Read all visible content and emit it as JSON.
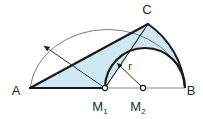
{
  "figure": {
    "colors": {
      "fill": "#cfe9f2",
      "stroke_dark": "#1a1a1a",
      "stroke_thin": "#6b6b6b",
      "baseline": "#8a8a8a",
      "label": "#2b2b2b",
      "background": "#ffffff"
    },
    "points": [
      {
        "name": "A",
        "label": "A",
        "x": 30,
        "y": 88,
        "label_x": 16,
        "label_y": 95,
        "marker": "none"
      },
      {
        "name": "B",
        "label": "B",
        "x": 185,
        "y": 88,
        "label_x": 191,
        "label_y": 95,
        "marker": "none"
      },
      {
        "name": "C",
        "label": "C",
        "x": 148,
        "y": 24,
        "label_x": 145,
        "label_y": 14,
        "marker": "none"
      },
      {
        "name": "M1",
        "label": "M",
        "sub": "1",
        "x": 105,
        "y": 88,
        "label_x": 98,
        "label_y": 111,
        "marker": "open-circle"
      },
      {
        "name": "M2",
        "label": "M",
        "sub": "2",
        "x": 143,
        "y": 88,
        "label_x": 136,
        "label_y": 111,
        "marker": "open-circle"
      }
    ],
    "annotations": [
      {
        "name": "radius-r",
        "label": "r",
        "x": 130,
        "y": 68
      }
    ],
    "arcs": [
      {
        "name": "large-semicircle",
        "from": "A",
        "to": "B",
        "center": "M1",
        "style": "thin"
      },
      {
        "name": "small-semicircle",
        "from": "M1",
        "to": "B",
        "center": "M2",
        "style": "thick"
      },
      {
        "name": "arc-c-to-b",
        "from": "C",
        "to": "B",
        "style": "thick"
      }
    ],
    "segments": [
      {
        "name": "baseline-AB",
        "from": "A",
        "to": "B"
      },
      {
        "name": "side-AC",
        "from": "A",
        "to": "C"
      },
      {
        "name": "side-CM1",
        "from": "C",
        "to": "M1"
      }
    ],
    "arrows": [
      {
        "name": "radius-arrow-large",
        "from": "M1",
        "to_x": 43,
        "to_y": 45
      },
      {
        "name": "radius-arrow-small",
        "from": "M2",
        "to_x": 116,
        "to_y": 62
      }
    ]
  }
}
